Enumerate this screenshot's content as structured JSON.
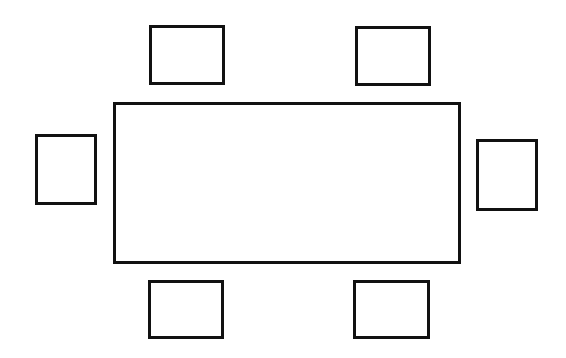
{
  "diagram": {
    "title": "",
    "type": "seating-layout",
    "canvas": {
      "width": 566,
      "height": 358,
      "background": "#ffffff"
    },
    "stroke_color": "#111111",
    "stroke_width": 3,
    "table": {
      "label": "",
      "shape": "rectangle",
      "x": 113,
      "y": 102,
      "width": 348,
      "height": 162
    },
    "chairs": [
      {
        "id": "top-left",
        "label": "",
        "x": 149,
        "y": 25,
        "width": 76,
        "height": 60
      },
      {
        "id": "top-right",
        "label": "",
        "x": 355,
        "y": 26,
        "width": 76,
        "height": 60
      },
      {
        "id": "left",
        "label": "",
        "x": 35,
        "y": 134,
        "width": 62,
        "height": 71
      },
      {
        "id": "right",
        "label": "",
        "x": 476,
        "y": 139,
        "width": 62,
        "height": 72
      },
      {
        "id": "bottom-left",
        "label": "",
        "x": 148,
        "y": 280,
        "width": 76,
        "height": 59
      },
      {
        "id": "bottom-right",
        "label": "",
        "x": 353,
        "y": 280,
        "width": 77,
        "height": 59
      }
    ],
    "chair_count": 6
  }
}
